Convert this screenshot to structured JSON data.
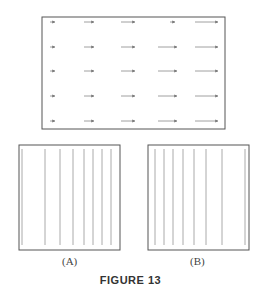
{
  "figure": {
    "caption": "FIGURE 13",
    "panel_a_label": "(A)",
    "panel_b_label": "(B)"
  },
  "vector_field": {
    "description": "5x5 grid of horizontal arrows pointing right; length increases with column (left to right), roughly constant down rows",
    "rows": 5,
    "columns": 5,
    "direction": "right",
    "relative_lengths_by_column": [
      1,
      3,
      4,
      5,
      7
    ]
  },
  "panel_a": {
    "description": "vertical lines, spacing decreasing to the right (denser on right)",
    "line_x_positions": [
      22,
      45,
      60,
      73,
      84,
      93,
      102,
      111
    ]
  },
  "panel_b": {
    "description": "vertical lines, spacing increasing to the right (denser on left)",
    "line_x_positions": [
      155,
      164,
      173,
      183,
      194,
      206,
      222,
      245
    ]
  },
  "colors": {
    "line": "#999999",
    "border": "#555555",
    "arrow": "#777777"
  }
}
